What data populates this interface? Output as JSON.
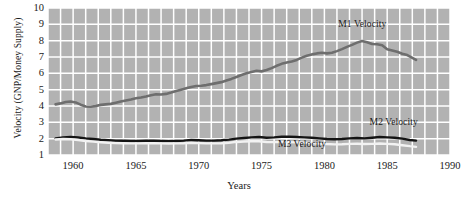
{
  "chart_data": {
    "type": "line",
    "title": "",
    "xlabel": "Years",
    "ylabel": "Velocity (GNP/Money Supply)",
    "xlim": [
      1958.0,
      1990.0
    ],
    "ylim": [
      1,
      10
    ],
    "xticks": [
      1960,
      1965,
      1970,
      1975,
      1980,
      1985,
      1990
    ],
    "yticks": [
      1,
      2,
      3,
      4,
      5,
      6,
      7,
      8,
      9,
      10
    ],
    "grid": true,
    "grid_color": "#ffffff",
    "plot_background": "#b2b2b2",
    "legend_position": "inline-annotations",
    "series": [
      {
        "name": "M1 Velocity",
        "color": "#6e6e6e",
        "label_x": 1981.1,
        "label_y": 8.95,
        "x": [
          1958.6,
          1959.0,
          1959.4,
          1959.8,
          1960.2,
          1960.6,
          1961.0,
          1961.4,
          1961.8,
          1962.2,
          1962.6,
          1963.0,
          1963.4,
          1963.8,
          1964.2,
          1964.6,
          1965.0,
          1965.4,
          1965.8,
          1966.2,
          1966.6,
          1967.0,
          1967.4,
          1967.8,
          1968.2,
          1968.6,
          1969.0,
          1969.4,
          1969.8,
          1970.2,
          1970.6,
          1971.0,
          1971.4,
          1971.8,
          1972.2,
          1972.6,
          1973.0,
          1973.4,
          1973.8,
          1974.2,
          1974.6,
          1975.0,
          1975.4,
          1975.8,
          1976.2,
          1976.6,
          1977.0,
          1977.4,
          1977.8,
          1978.2,
          1978.6,
          1979.0,
          1979.4,
          1979.8,
          1980.2,
          1980.6,
          1981.0,
          1981.4,
          1981.8,
          1982.2,
          1982.6,
          1983.0,
          1983.4,
          1983.8,
          1984.2,
          1984.6,
          1985.0,
          1985.4,
          1985.8,
          1986.2,
          1986.6,
          1987.0,
          1987.3
        ],
        "y": [
          4.1,
          4.16,
          4.24,
          4.28,
          4.22,
          4.08,
          3.97,
          3.95,
          4.0,
          4.07,
          4.1,
          4.13,
          4.2,
          4.27,
          4.34,
          4.4,
          4.47,
          4.52,
          4.58,
          4.66,
          4.72,
          4.7,
          4.74,
          4.82,
          4.92,
          5.0,
          5.08,
          5.16,
          5.22,
          5.24,
          5.28,
          5.34,
          5.4,
          5.46,
          5.56,
          5.66,
          5.78,
          5.9,
          6.0,
          6.08,
          6.16,
          6.12,
          6.2,
          6.32,
          6.46,
          6.58,
          6.66,
          6.72,
          6.82,
          6.96,
          7.08,
          7.16,
          7.22,
          7.26,
          7.22,
          7.26,
          7.36,
          7.48,
          7.62,
          7.74,
          7.88,
          7.98,
          7.9,
          7.8,
          7.78,
          7.72,
          7.48,
          7.4,
          7.32,
          7.2,
          7.12,
          6.95,
          6.82
        ]
      },
      {
        "name": "M2 Velocity",
        "color": "#141414",
        "label_x": 1983.6,
        "label_y": 2.98,
        "x": [
          1958.6,
          1959.2,
          1959.8,
          1960.4,
          1961.0,
          1961.6,
          1962.2,
          1962.8,
          1963.4,
          1964.0,
          1964.6,
          1965.2,
          1965.8,
          1966.4,
          1967.0,
          1967.6,
          1968.2,
          1968.8,
          1969.4,
          1970.0,
          1970.6,
          1971.2,
          1971.8,
          1972.4,
          1973.0,
          1973.6,
          1974.2,
          1974.8,
          1975.4,
          1976.0,
          1976.6,
          1977.2,
          1977.8,
          1978.4,
          1979.0,
          1979.6,
          1980.2,
          1980.8,
          1981.4,
          1982.0,
          1982.6,
          1983.2,
          1983.8,
          1984.4,
          1985.0,
          1985.6,
          1986.2,
          1986.8,
          1987.3
        ],
        "y": [
          2.02,
          2.08,
          2.1,
          2.07,
          2.02,
          1.98,
          1.93,
          1.9,
          1.88,
          1.87,
          1.86,
          1.86,
          1.87,
          1.88,
          1.86,
          1.85,
          1.86,
          1.88,
          1.92,
          1.9,
          1.88,
          1.88,
          1.9,
          1.94,
          2.0,
          2.04,
          2.08,
          2.1,
          2.06,
          2.08,
          2.12,
          2.12,
          2.1,
          2.08,
          2.06,
          2.02,
          1.98,
          1.96,
          1.98,
          2.02,
          2.04,
          2.02,
          2.06,
          2.1,
          2.08,
          2.06,
          2.0,
          1.92,
          1.88
        ]
      },
      {
        "name": "M3 Velocity",
        "color": "#f2f2f2",
        "label_x": 1976.3,
        "label_y": 1.62,
        "x": [
          1958.6,
          1959.2,
          1959.8,
          1960.4,
          1961.0,
          1961.6,
          1962.2,
          1962.8,
          1963.4,
          1964.0,
          1964.6,
          1965.2,
          1965.8,
          1966.4,
          1967.0,
          1967.6,
          1968.2,
          1968.8,
          1969.4,
          1970.0,
          1970.6,
          1971.2,
          1971.8,
          1972.4,
          1973.0,
          1973.6,
          1974.2,
          1974.8,
          1975.4,
          1976.0,
          1976.6,
          1977.2,
          1977.8,
          1978.4,
          1979.0,
          1979.6,
          1980.2,
          1980.8,
          1981.4,
          1982.0,
          1982.6,
          1983.2,
          1983.8,
          1984.4,
          1985.0,
          1985.6,
          1986.2,
          1986.8,
          1987.3
        ],
        "y": [
          1.95,
          1.98,
          1.96,
          1.92,
          1.86,
          1.82,
          1.78,
          1.75,
          1.73,
          1.72,
          1.71,
          1.71,
          1.72,
          1.73,
          1.71,
          1.7,
          1.71,
          1.72,
          1.75,
          1.73,
          1.71,
          1.71,
          1.72,
          1.75,
          1.8,
          1.83,
          1.84,
          1.84,
          1.8,
          1.79,
          1.8,
          1.79,
          1.77,
          1.75,
          1.73,
          1.7,
          1.67,
          1.65,
          1.66,
          1.68,
          1.69,
          1.67,
          1.68,
          1.7,
          1.68,
          1.66,
          1.6,
          1.54,
          1.5
        ]
      }
    ]
  }
}
